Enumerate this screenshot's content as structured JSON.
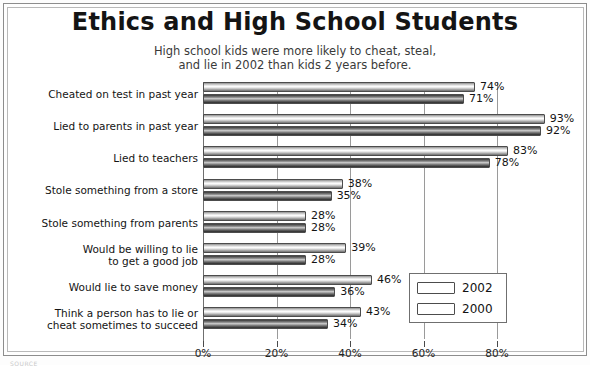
{
  "figure": {
    "title": "Ethics and High School Students",
    "subtitle_line1": "High school kids were more likely to cheat, steal,",
    "subtitle_line2": "and lie in 2002 than kids 2 years before.",
    "source_note": "SOURCE"
  },
  "legend": {
    "position": "inside-bottom-right",
    "entries": [
      {
        "label": "2002",
        "swatch": "light-cylinder-swatch",
        "color": "#e8e8e8"
      },
      {
        "label": "2000",
        "swatch": "dark-cylinder-swatch",
        "color": "#5a5a5a"
      }
    ]
  },
  "axis": {
    "ticks": [
      "0%",
      "20%",
      "40%",
      "60%",
      "80%"
    ],
    "tick_values": [
      0,
      20,
      40,
      60,
      80
    ]
  },
  "chart_data": {
    "type": "bar",
    "orientation": "horizontal",
    "title": "Ethics and High School Students",
    "subtitle": "High school kids were more likely to cheat, steal, and lie in 2002 than kids 2 years before.",
    "xlabel": "",
    "ylabel": "",
    "xlim": [
      0,
      80
    ],
    "grid": true,
    "grid_axis": "x",
    "legend_position": "lower right",
    "tick_labels": [
      "0%",
      "20%",
      "40%",
      "60%",
      "80%"
    ],
    "categories": [
      "Cheated on test in past year",
      "Lied to parents in past year",
      "Lied to teachers",
      "Stole something from a store",
      "Stole something from parents",
      "Would be willing to lie to get a good job",
      "Would lie to save money",
      "Think a person has to lie or cheat sometimes to succeed"
    ],
    "category_lines": [
      [
        "Cheated on test in past year"
      ],
      [
        "Lied to parents in past year"
      ],
      [
        "Lied to teachers"
      ],
      [
        "Stole something from a store"
      ],
      [
        "Stole something from parents"
      ],
      [
        "Would be willing to lie",
        "to get a good job"
      ],
      [
        "Would lie to save money"
      ],
      [
        "Think a person has to lie or",
        "cheat sometimes to succeed"
      ]
    ],
    "series": [
      {
        "name": "2002",
        "values": [
          74,
          93,
          83,
          38,
          28,
          39,
          46,
          43
        ],
        "labels": [
          "74%",
          "93%",
          "83%",
          "38%",
          "28%",
          "39%",
          "46%",
          "43%"
        ]
      },
      {
        "name": "2000",
        "values": [
          71,
          92,
          78,
          35,
          28,
          28,
          36,
          34
        ],
        "labels": [
          "71%",
          "92%",
          "78%",
          "35%",
          "28%",
          "28%",
          "36%",
          "34%"
        ]
      }
    ]
  }
}
